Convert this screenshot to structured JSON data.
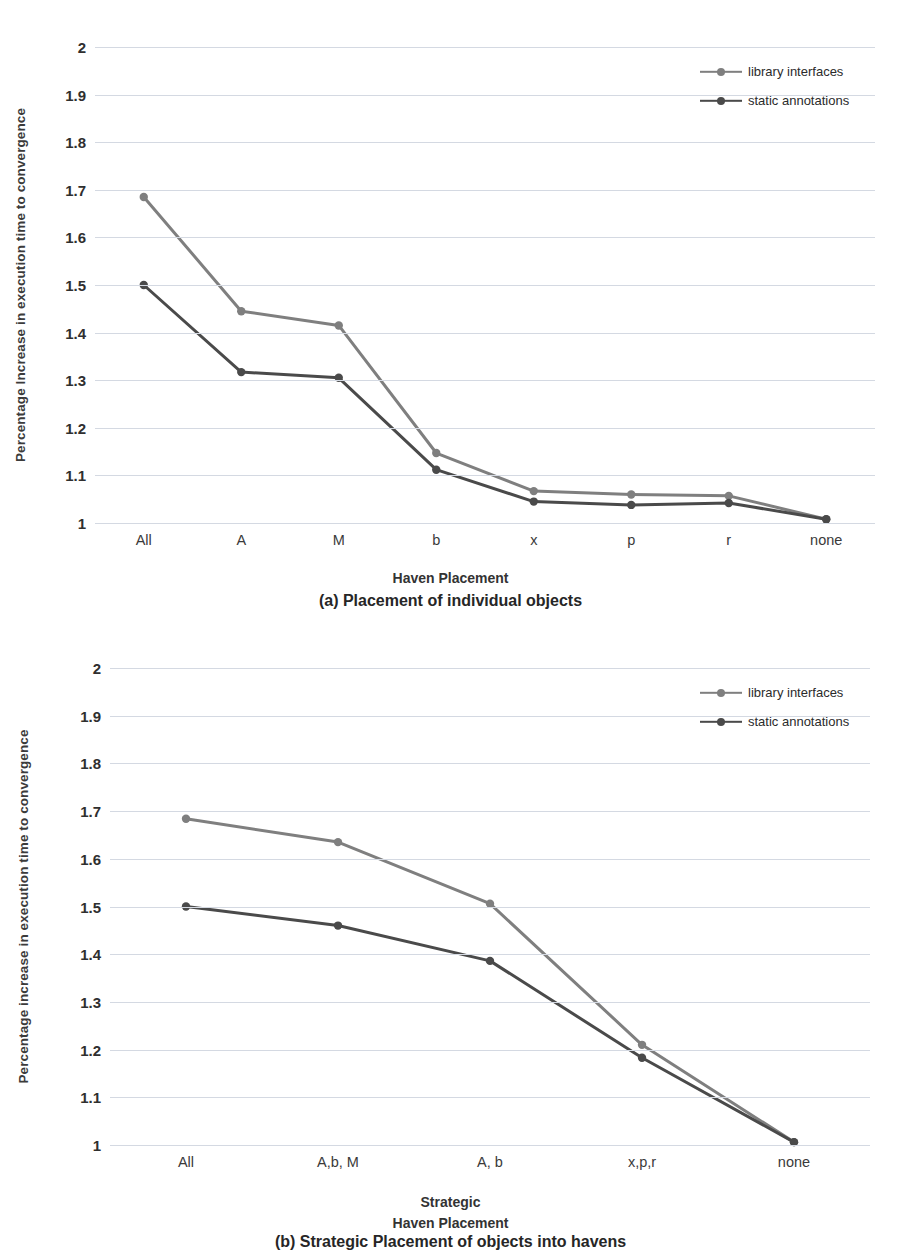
{
  "colors": {
    "library_interfaces": "#7f7f7f",
    "static_annotations": "#4a4a4a",
    "gridline": "#d4d9e2",
    "text": "#2f2f2f"
  },
  "figures": [
    {
      "id": "a",
      "caption": "(a) Placement of individual objects",
      "ylabel": "Percentage Increase in execution time to convergence",
      "xlabel_lines": [
        "Haven Placement"
      ],
      "legend": [
        {
          "label": "library interfaces",
          "color": "#7f7f7f"
        },
        {
          "label": "static annotations",
          "color": "#4a4a4a"
        }
      ],
      "chart_data": {
        "type": "line",
        "title": "(a) Placement of individual objects",
        "xlabel": "Haven Placement",
        "ylabel": "Percentage Increase in execution time to convergence",
        "categories": [
          "All",
          "A",
          "M",
          "b",
          "x",
          "p",
          "r",
          "none"
        ],
        "ylim": [
          1,
          2
        ],
        "yticks": [
          "1",
          "1.1",
          "1.2",
          "1.3",
          "1.4",
          "1.5",
          "1.6",
          "1.7",
          "1.8",
          "1.9",
          "2"
        ],
        "grid": true,
        "legend_position": "top-right",
        "series": [
          {
            "name": "library interfaces",
            "color": "#7f7f7f",
            "values": [
              1.685,
              1.445,
              1.415,
              1.147,
              1.067,
              1.06,
              1.057,
              1.008
            ]
          },
          {
            "name": "static annotations",
            "color": "#4a4a4a",
            "values": [
              1.5,
              1.317,
              1.305,
              1.112,
              1.045,
              1.038,
              1.042,
              1.008
            ]
          }
        ]
      }
    },
    {
      "id": "b",
      "caption": "(b) Strategic Placement of objects into havens",
      "ylabel": "Percentage increase in execution time to convergence",
      "xlabel_lines": [
        "Strategic",
        "Haven Placement"
      ],
      "legend": [
        {
          "label": "library interfaces",
          "color": "#7f7f7f"
        },
        {
          "label": "static annotations",
          "color": "#4a4a4a"
        }
      ],
      "chart_data": {
        "type": "line",
        "title": "(b) Strategic Placement of objects into havens",
        "xlabel": "Strategic Haven Placement",
        "ylabel": "Percentage increase in execution time to convergence",
        "categories": [
          "All",
          "A,b, M",
          "A, b",
          "x,p,r",
          "none"
        ],
        "ylim": [
          1,
          2
        ],
        "yticks": [
          "1",
          "1.1",
          "1.2",
          "1.3",
          "1.4",
          "1.5",
          "1.6",
          "1.7",
          "1.8",
          "1.9",
          "2"
        ],
        "grid": true,
        "legend_position": "top-right",
        "series": [
          {
            "name": "library interfaces",
            "color": "#7f7f7f",
            "values": [
              1.684,
              1.635,
              1.506,
              1.21,
              1.006
            ]
          },
          {
            "name": "static annotations",
            "color": "#4a4a4a",
            "values": [
              1.5,
              1.46,
              1.386,
              1.183,
              1.006
            ]
          }
        ]
      }
    }
  ]
}
